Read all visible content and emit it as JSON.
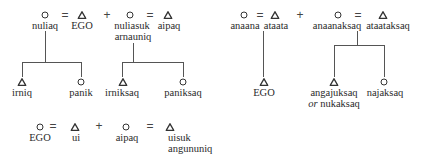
{
  "diagram": {
    "type": "kinship-terminology",
    "symbols": {
      "female": "circle",
      "male": "triangle",
      "marriage": "=",
      "sibling_link": "+"
    },
    "panels": [
      {
        "id": "left-top",
        "parents_row": [
          {
            "sex": "female",
            "label": "nuliaq"
          },
          {
            "op": "="
          },
          {
            "sex": "male",
            "label": "EGO"
          },
          {
            "op": "+"
          },
          {
            "sex": "female",
            "label": "nuliasuk",
            "label2": "arnauniq"
          },
          {
            "op": "="
          },
          {
            "sex": "male",
            "label": "aipaq"
          }
        ],
        "children_of_nuliaq": [
          {
            "sex": "male",
            "label": "irniq"
          },
          {
            "sex": "female",
            "label": "panik"
          }
        ],
        "children_of_nuliasuk": [
          {
            "sex": "male",
            "label": "irniksaq"
          },
          {
            "sex": "female",
            "label": "paniksaq"
          }
        ]
      },
      {
        "id": "right-top",
        "parents_row": [
          {
            "sex": "female",
            "label": "anaana"
          },
          {
            "op": "="
          },
          {
            "sex": "male",
            "label": "ataata"
          },
          {
            "op": "+"
          },
          {
            "sex": "female",
            "label": "anaanaksaq"
          },
          {
            "op": "="
          },
          {
            "sex": "male",
            "label": "ataataksaq"
          }
        ],
        "children_of_anaana": [
          {
            "sex": "male",
            "label": "EGO"
          }
        ],
        "children_of_anaanaksaq": [
          {
            "sex": "male",
            "label": "angajuksaq",
            "label2_prefix": "or",
            "label2": "nukaksaq"
          },
          {
            "sex": "female",
            "label": "najaksaq"
          }
        ]
      },
      {
        "id": "bottom",
        "row": [
          {
            "sex": "female",
            "label": "EGO"
          },
          {
            "op": "="
          },
          {
            "sex": "male",
            "label": "ui"
          },
          {
            "op": "+"
          },
          {
            "sex": "female",
            "label": "aipaq"
          },
          {
            "op": "="
          },
          {
            "sex": "male",
            "label": "uisuk",
            "label2": "angununiq"
          }
        ]
      }
    ]
  }
}
